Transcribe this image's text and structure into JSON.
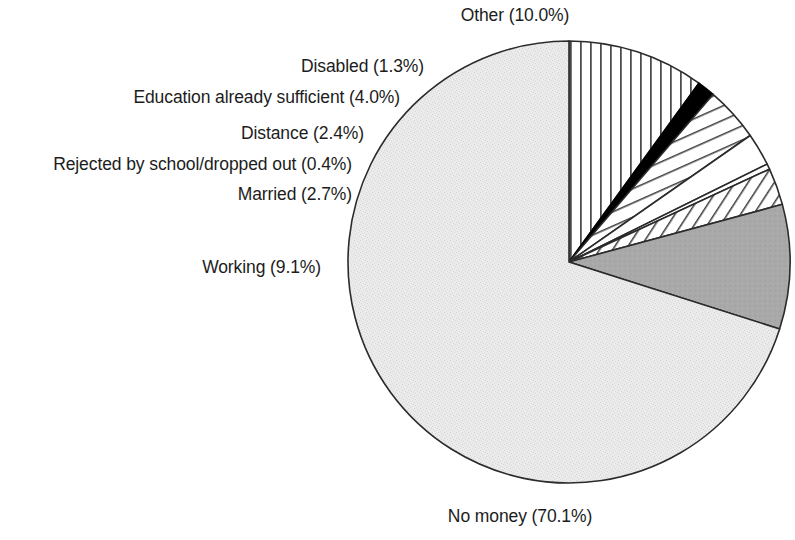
{
  "chart_data": {
    "type": "pie",
    "title": "",
    "subtitle": "",
    "xlabel": "",
    "ylabel": "",
    "legend_position": "none",
    "grid": false,
    "units": "percent",
    "labels": [
      "Other",
      "Disabled",
      "Education already sufficient",
      "Distance",
      "Rejected by school/dropped out",
      "Married",
      "Working",
      "No money"
    ],
    "values": [
      10.0,
      1.3,
      4.0,
      2.4,
      0.4,
      2.7,
      9.1,
      70.1
    ],
    "total": 100.0,
    "start_angle_deg": 0,
    "direction": "clockwise",
    "slices": [
      {
        "label": "Other",
        "value": 10.0,
        "display": "Other (10.0%)",
        "fill": "#ffffff",
        "pattern": "vertical-lines",
        "stroke": "#2b2b2b",
        "start_deg": 0.0,
        "end_deg": 36.0
      },
      {
        "label": "Disabled",
        "value": 1.3,
        "display": "Disabled (1.3%)",
        "fill": "#000000",
        "pattern": "solid",
        "stroke": "#000000",
        "start_deg": 36.0,
        "end_deg": 40.68
      },
      {
        "label": "Education already sufficient",
        "value": 4.0,
        "display": "Education already sufficient (4.0%)",
        "fill": "#ffffff",
        "pattern": "diagonal-lines",
        "stroke": "#2b2b2b",
        "start_deg": 40.68,
        "end_deg": 55.08
      },
      {
        "label": "Distance",
        "value": 2.4,
        "display": "Distance (2.4%)",
        "fill": "#ffffff",
        "pattern": "none",
        "stroke": "#2b2b2b",
        "start_deg": 55.08,
        "end_deg": 63.72
      },
      {
        "label": "Rejected by school/dropped out",
        "value": 0.4,
        "display": "Rejected by school/dropped out (0.4%)",
        "fill": "#ffffff",
        "pattern": "none",
        "stroke": "#2b2b2b",
        "start_deg": 63.72,
        "end_deg": 65.16
      },
      {
        "label": "Married",
        "value": 2.7,
        "display": "Married (2.7%)",
        "fill": "#ffffff",
        "pattern": "diagonal-hatch",
        "stroke": "#2b2b2b",
        "start_deg": 65.16,
        "end_deg": 74.88
      },
      {
        "label": "Working",
        "value": 9.1,
        "display": "Working (9.1%)",
        "fill": "#a9a9a9",
        "pattern": "solid",
        "stroke": "#2b2b2b",
        "start_deg": 74.88,
        "end_deg": 107.64
      },
      {
        "label": "No money",
        "value": 70.1,
        "display": "No money (70.1%)",
        "fill": "#e7e7e7",
        "pattern": "stipple",
        "stroke": "#2b2b2b",
        "start_deg": 107.64,
        "end_deg": 360.0
      }
    ],
    "geometry": {
      "center_x": 569,
      "center_y": 262,
      "radius": 221
    },
    "colors": {
      "outline": "#2b2b2b",
      "text": "#1c1c1c",
      "background": "#ffffff",
      "working_gray": "#a9a9a9",
      "no_money_gray": "#e7e7e7",
      "disabled_black": "#000000"
    }
  },
  "labels": {
    "other": "Other (10.0%)",
    "disabled": "Disabled (1.3%)",
    "education": "Education already sufficient (4.0%)",
    "distance": "Distance (2.4%)",
    "rejected": "Rejected by school/dropped out (0.4%)",
    "married": "Married (2.7%)",
    "working": "Working (9.1%)",
    "no_money": "No money (70.1%)"
  }
}
